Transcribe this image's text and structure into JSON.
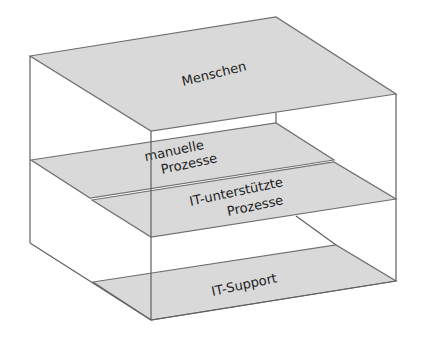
{
  "diagram": {
    "type": "layered-box",
    "layers": [
      {
        "id": "menschen",
        "label_lines": [
          "Menschen"
        ]
      },
      {
        "id": "manuelle-prozesse",
        "label_lines": [
          "manuelle",
          "Prozesse"
        ]
      },
      {
        "id": "it-prozesse",
        "label_lines": [
          "IT-unterstützte",
          "Prozesse"
        ]
      },
      {
        "id": "it-support",
        "label_lines": [
          "IT-Support"
        ]
      }
    ],
    "colors": {
      "plane_fill": "#d9d9d9",
      "edge": "#606060",
      "text": "#222222",
      "background": "#ffffff"
    }
  }
}
